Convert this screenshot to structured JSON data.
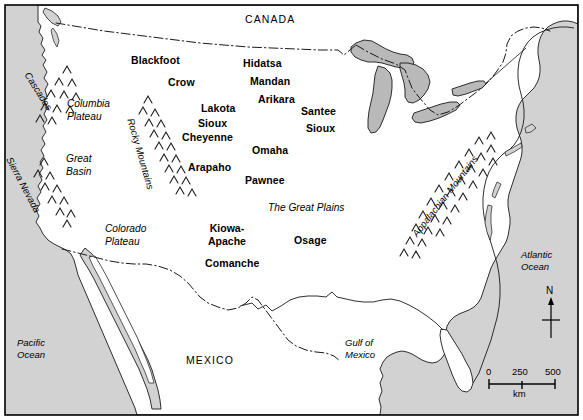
{
  "map": {
    "title": "Native American tribes of North America",
    "colors": {
      "ocean_fill": "#d2d2d2",
      "land_fill": "#ffffff",
      "lake_fill": "#b9b9b9",
      "outline": "#000000",
      "border_dash": "#000000",
      "frame": "#000000"
    },
    "countries": [
      {
        "name": "CANADA",
        "x": 245,
        "y": 14
      },
      {
        "name": "MEXICO",
        "x": 186,
        "y": 355
      }
    ],
    "oceans": [
      {
        "name": "Pacific\nOcean",
        "x": 17,
        "y": 337
      },
      {
        "name": "Atlantic\nOcean",
        "x": 521,
        "y": 249
      },
      {
        "name": "Gulf of\nMexico",
        "x": 345,
        "y": 337
      }
    ],
    "regions": [
      {
        "name": "Columbia\nPlateau",
        "x": 67,
        "y": 98
      },
      {
        "name": "Great\nBasin",
        "x": 66,
        "y": 153
      },
      {
        "name": "Colorado\nPlateau",
        "x": 105,
        "y": 223
      },
      {
        "name": "The Great Plains",
        "x": 268,
        "y": 202
      }
    ],
    "mountain_ranges": [
      {
        "name": "Cascades",
        "x": 32,
        "y": 70,
        "rotation": 58
      },
      {
        "name": "Sierra Nevada",
        "x": 14,
        "y": 155,
        "rotation": 62
      },
      {
        "name": "Rocky Mountains",
        "x": 136,
        "y": 117,
        "rotation": 74
      },
      {
        "name": "Appalachian Mountains",
        "x": 410,
        "y": 232,
        "rotation": -52
      }
    ],
    "tribes": [
      {
        "name": "Blackfoot",
        "x": 131,
        "y": 55,
        "lines": 1
      },
      {
        "name": "Crow",
        "x": 168,
        "y": 77,
        "lines": 1
      },
      {
        "name": "Hidatsa",
        "x": 243,
        "y": 58,
        "lines": 1
      },
      {
        "name": "Mandan",
        "x": 250,
        "y": 76,
        "lines": 1
      },
      {
        "name": "Arikara",
        "x": 258,
        "y": 94,
        "lines": 1
      },
      {
        "name": "Lakota",
        "x": 201,
        "y": 103,
        "lines": 1
      },
      {
        "name": "Santee",
        "x": 301,
        "y": 106,
        "lines": 1
      },
      {
        "name": "Sioux",
        "x": 198,
        "y": 118,
        "lines": 1
      },
      {
        "name": "Cheyenne",
        "x": 182,
        "y": 132,
        "lines": 1
      },
      {
        "name": "Sioux",
        "x": 306,
        "y": 123,
        "lines": 1
      },
      {
        "name": "Omaha",
        "x": 252,
        "y": 145,
        "lines": 1
      },
      {
        "name": "Arapaho",
        "x": 188,
        "y": 162,
        "lines": 1
      },
      {
        "name": "Pawnee",
        "x": 245,
        "y": 175,
        "lines": 1
      },
      {
        "name": "Kiowa-\nApache",
        "x": 208,
        "y": 222,
        "lines": 2
      },
      {
        "name": "Osage",
        "x": 294,
        "y": 235,
        "lines": 1
      },
      {
        "name": "Comanche",
        "x": 205,
        "y": 258,
        "lines": 1
      }
    ],
    "scale_bar": {
      "ticks": [
        "0",
        "250",
        "500"
      ],
      "unit": "km",
      "x": 489,
      "y": 373,
      "width": 66
    },
    "compass": {
      "label": "N",
      "x": 548,
      "y": 300
    }
  }
}
